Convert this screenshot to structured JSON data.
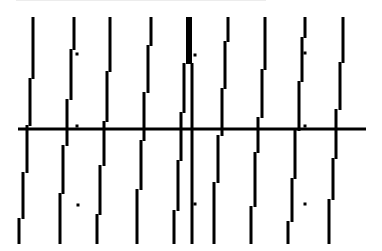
{
  "image": {
    "width": 382,
    "height": 251,
    "background": "#ffffff",
    "ink": "#000000",
    "description": "Sheared vertical line pattern crossed by a horizontal line"
  },
  "horizontal_line": {
    "x1": 18,
    "x2": 366,
    "y": 129,
    "thickness": 3
  },
  "stroke_width": 3,
  "columns": [
    {
      "name": "col-1",
      "segments": [
        [
          33,
          17,
          78
        ],
        [
          30,
          78,
          125
        ],
        [
          27,
          125,
          172
        ],
        [
          23,
          172,
          218
        ],
        [
          19,
          218,
          243
        ]
      ]
    },
    {
      "name": "col-2",
      "segments": [
        [
          74,
          17,
          49
        ],
        [
          71,
          49,
          99
        ],
        [
          67,
          99,
          145
        ],
        [
          63,
          145,
          193
        ],
        [
          60,
          193,
          243
        ]
      ]
    },
    {
      "name": "col-3",
      "segments": [
        [
          110,
          17,
          71
        ],
        [
          107,
          71,
          121
        ],
        [
          104,
          121,
          165
        ],
        [
          100,
          165,
          214
        ],
        [
          97,
          214,
          243
        ]
      ]
    },
    {
      "name": "col-4",
      "segments": [
        [
          151,
          17,
          45
        ],
        [
          148,
          45,
          92
        ],
        [
          144,
          92,
          140
        ],
        [
          141,
          140,
          189
        ],
        [
          137,
          189,
          243
        ]
      ]
    },
    {
      "name": "col-5",
      "segments": [
        [
          184,
          63,
          112
        ],
        [
          181,
          112,
          160
        ],
        [
          178,
          160,
          210
        ],
        [
          174,
          210,
          243
        ]
      ]
    },
    {
      "name": "col-5b",
      "segments": [
        [
          192,
          63,
          243
        ]
      ]
    },
    {
      "name": "col-6",
      "segments": [
        [
          228,
          17,
          41
        ],
        [
          225,
          41,
          88
        ],
        [
          222,
          88,
          135
        ],
        [
          218,
          135,
          182
        ],
        [
          214,
          182,
          243
        ]
      ]
    },
    {
      "name": "col-7",
      "segments": [
        [
          265,
          17,
          69
        ],
        [
          262,
          69,
          117
        ],
        [
          258,
          117,
          152
        ],
        [
          255,
          152,
          206
        ],
        [
          251,
          206,
          243
        ]
      ]
    },
    {
      "name": "col-8",
      "segments": [
        [
          305,
          17,
          37
        ],
        [
          302,
          37,
          81
        ],
        [
          299,
          81,
          130
        ],
        [
          295,
          130,
          178
        ],
        [
          292,
          178,
          221
        ],
        [
          288,
          221,
          243
        ]
      ]
    },
    {
      "name": "col-9",
      "segments": [
        [
          343,
          17,
          62
        ],
        [
          340,
          62,
          109
        ],
        [
          336,
          109,
          158
        ],
        [
          333,
          158,
          199
        ],
        [
          329,
          199,
          243
        ]
      ]
    }
  ],
  "thick_block": {
    "x": 186,
    "y": 17,
    "width": 6,
    "height": 47
  },
  "dots": [
    [
      77,
      54
    ],
    [
      77,
      126
    ],
    [
      78,
      205
    ],
    [
      195,
      55
    ],
    [
      195,
      204
    ],
    [
      305,
      53
    ],
    [
      305,
      126
    ],
    [
      305,
      204
    ]
  ]
}
